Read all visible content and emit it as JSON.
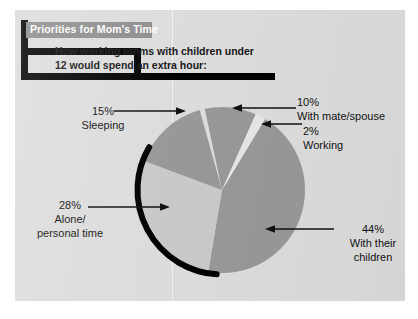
{
  "panel": {
    "background_color": "#dcdcdc",
    "page_background_color": "#ffffff"
  },
  "header": {
    "title": "Priorities for Mom's Time",
    "title_banner_color": "#8d8d8d",
    "title_text_color": "#ffffff",
    "bracket_color": "#000000",
    "subtitle_line1": "How  working moms with children under",
    "subtitle_line2": "12 would spend an extra hour:"
  },
  "chart_data": {
    "type": "pie",
    "title": "Priorities for Mom's Time",
    "subtitle": "How  working moms with children under 12 would spend an extra hour:",
    "unit": "percent",
    "categories": [
      "With their children",
      "Alone/ personal time",
      "Sleeping",
      "With mate/spouse",
      "Working"
    ],
    "values": [
      44,
      28,
      15,
      10,
      2
    ],
    "labels": [
      {
        "pct": "44%",
        "desc_line1": "With their",
        "desc_line2": "children",
        "color": "#989898"
      },
      {
        "pct": "28%",
        "desc_line1": "Alone/",
        "desc_line2": "personal time",
        "color": "#c9c9c9"
      },
      {
        "pct": "15%",
        "desc_line1": "Sleeping",
        "desc_line2": "",
        "color": "#989898"
      },
      {
        "pct": "10%",
        "desc_line1": "With mate/spouse",
        "desc_line2": "",
        "color": "#989898"
      },
      {
        "pct": "2%",
        "desc_line1": "Working",
        "desc_line2": "",
        "color": "#e6e6e6"
      }
    ],
    "legend": "none",
    "grid": false,
    "colors": {
      "slice_dark": "#989898",
      "slice_light": "#c9c9c9",
      "slice_sliver": "#e6e6e6",
      "outline": "#000000",
      "arrow": "#111111",
      "label_text": "#111111"
    },
    "geometry": {
      "center_x": 222,
      "center_y": 190,
      "radius": 83
    }
  }
}
